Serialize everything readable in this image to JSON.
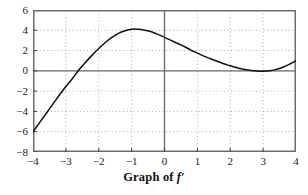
{
  "figure": {
    "caption_text": "Graph of",
    "caption_symbol": "f′"
  },
  "chart_data": {
    "type": "line",
    "xlabel": "",
    "ylabel": "",
    "xlim": [
      -4,
      4
    ],
    "ylim": [
      -8,
      6
    ],
    "xticks": [
      -4,
      -3,
      -2,
      -1,
      0,
      1,
      2,
      3,
      4
    ],
    "xtick_labels": [
      "−4",
      "−3",
      "−2",
      "−1",
      "0",
      "1",
      "2",
      "3",
      "4"
    ],
    "yticks": [
      -8,
      -6,
      -4,
      -2,
      0,
      2,
      4,
      6
    ],
    "ytick_labels": [
      "−8",
      "−6",
      "−4",
      "−2",
      "0",
      "2",
      "4",
      "6"
    ],
    "grid": "dotted",
    "grid_x_step": 1,
    "grid_y_step": 2,
    "legend": "none",
    "axis_lines": {
      "x_axis_at_y": 0,
      "y_axis_at_x": 0
    },
    "series": [
      {
        "name": "f'",
        "color": "#111111",
        "x": [
          -4.0,
          -3.8,
          -3.6,
          -3.4,
          -3.2,
          -3.0,
          -2.8,
          -2.6,
          -2.4,
          -2.2,
          -2.0,
          -1.8,
          -1.6,
          -1.4,
          -1.2,
          -1.0,
          -0.8,
          -0.6,
          -0.4,
          -0.2,
          0.0,
          0.2,
          0.4,
          0.6,
          0.8,
          1.0,
          1.2,
          1.4,
          1.6,
          1.8,
          2.0,
          2.2,
          2.4,
          2.6,
          2.8,
          3.0,
          3.2,
          3.4,
          3.6,
          3.8,
          4.0
        ],
        "y": [
          -6.0,
          -5.1,
          -4.2,
          -3.3,
          -2.4,
          -1.55,
          -0.75,
          0.1,
          0.85,
          1.55,
          2.2,
          2.8,
          3.3,
          3.7,
          3.95,
          4.1,
          4.1,
          4.0,
          3.85,
          3.6,
          3.3,
          3.0,
          2.7,
          2.4,
          2.05,
          1.75,
          1.45,
          1.2,
          0.95,
          0.7,
          0.5,
          0.3,
          0.15,
          0.05,
          -0.02,
          -0.05,
          0.0,
          0.15,
          0.35,
          0.65,
          1.0
        ]
      }
    ],
    "annotations": {
      "left_endpoint": {
        "x": -4,
        "y": -6
      },
      "zero_crossing": {
        "x": -2.62,
        "y": 0
      },
      "local_max": {
        "x": -0.9,
        "y": 4.1
      },
      "local_min": {
        "x": 3.0,
        "y": -0.05
      },
      "right_endpoint": {
        "x": 4,
        "y": 1
      }
    }
  }
}
